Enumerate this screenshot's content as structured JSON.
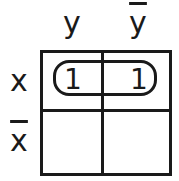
{
  "kmap": {
    "columns": [
      {
        "label": "y",
        "complemented": false
      },
      {
        "label": "y",
        "complemented": true
      }
    ],
    "rows": [
      {
        "label": "x",
        "complemented": false
      },
      {
        "label": "x",
        "complemented": true
      }
    ],
    "cells": [
      [
        "1",
        "1"
      ],
      [
        "",
        ""
      ]
    ],
    "groups": [
      {
        "covers": "row x",
        "cells": [
          [
            0,
            0
          ],
          [
            0,
            1
          ]
        ]
      }
    ]
  }
}
